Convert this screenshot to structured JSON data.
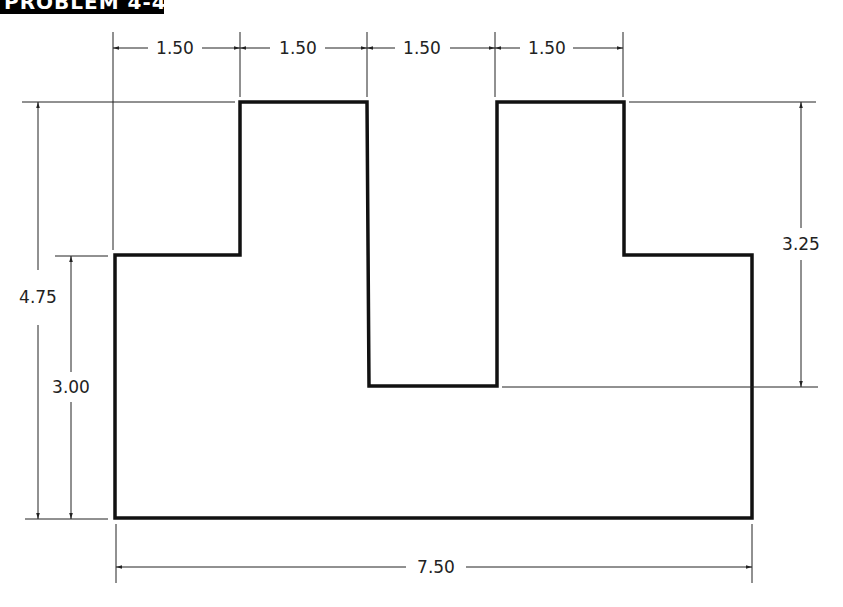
{
  "title": {
    "label": "PROBLEM 4-4"
  },
  "colors": {
    "outline": "#111111",
    "dimension": "#222222",
    "background": "#ffffff"
  },
  "dimensions": {
    "top": [
      "1.50",
      "1.50",
      "1.50",
      "1.50"
    ],
    "overall_height": "4.75",
    "step_height": "3.00",
    "slot_depth": "3.25",
    "overall_width": "7.50"
  },
  "shape": {
    "description": "U-shaped stepped block with central slot",
    "units": "inches"
  }
}
